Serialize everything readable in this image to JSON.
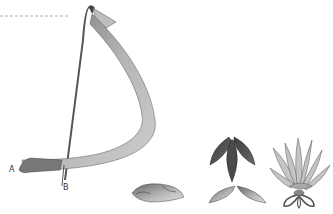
{
  "figure": {
    "type": "instructional illustration",
    "labels": {
      "point_a": "A",
      "point_b": "B"
    },
    "colors": {
      "background": "#ffffff",
      "ribbon_light": "#c8c8c8",
      "ribbon_mid": "#a0a0a0",
      "ribbon_dark": "#555555",
      "dashed_line": "#999999",
      "outline": "#3a3a3a"
    },
    "steps": [
      {
        "id": "ribbon-fold",
        "description": "long ribbon looped from A over top and down to B"
      },
      {
        "id": "single-petal",
        "description": "one flat pointed petal"
      },
      {
        "id": "petal-pair",
        "description": "two petals side by side"
      },
      {
        "id": "petal-trio",
        "description": "three dark petals joined at top"
      },
      {
        "id": "finished-flower",
        "description": "layered flower with looped base"
      }
    ]
  }
}
